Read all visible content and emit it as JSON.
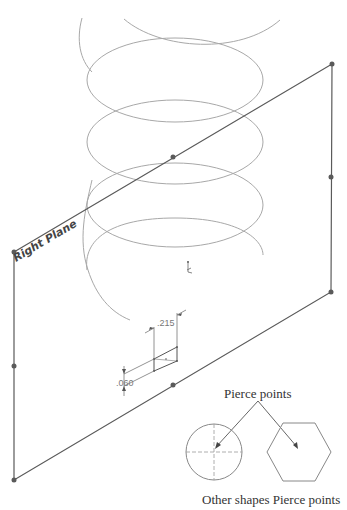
{
  "drawing": {
    "plane_label": "Right Plane",
    "dimensions": {
      "width": ".215",
      "height": ".060"
    },
    "callouts": {
      "pierce_points": "Pierce points",
      "caption": "Other shapes Pierce points"
    },
    "colors": {
      "helix": "#a8a8a8",
      "plane": "#5a5a5a",
      "dimension": "#777777",
      "background": "#ffffff"
    },
    "shapes": [
      "circle",
      "hexagon"
    ],
    "icons": [
      "origin-icon",
      "point-handle-icon",
      "arrow-icon"
    ]
  }
}
